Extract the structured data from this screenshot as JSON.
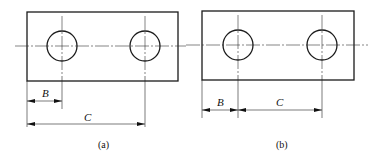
{
  "figures": [
    {
      "id": "a",
      "caption": "(a)",
      "dimensions": [
        {
          "label": "B",
          "from": "left edge",
          "to": "hole 1 center"
        },
        {
          "label": "C",
          "from": "left edge",
          "to": "hole 2 center"
        }
      ],
      "dimensioning_style": "parallel (baseline)"
    },
    {
      "id": "b",
      "caption": "(b)",
      "dimensions": [
        {
          "label": "B",
          "from": "left edge",
          "to": "hole 1 center"
        },
        {
          "label": "C",
          "from": "hole 1 center",
          "to": "hole 2 center"
        }
      ],
      "dimensioning_style": "chain"
    }
  ],
  "colors": {
    "line": "#1a1a1a",
    "background": "#ffffff"
  }
}
